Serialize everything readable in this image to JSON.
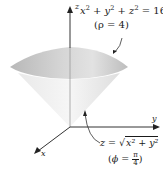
{
  "figure": {
    "axes": {
      "x_label": "x",
      "y_label": "y",
      "z_label": "z"
    },
    "sphere": {
      "equation_lhs_base": [
        "x",
        "y",
        "z"
      ],
      "equation_exponent": "2",
      "equation_plus": "+",
      "equation_rhs": "= 16",
      "rho_label": "(ρ = 4)"
    },
    "cone": {
      "equation_prefix": "z = √",
      "equation_radicand": "x² + y²",
      "phi_open": "(",
      "phi_text": "ϕ = ",
      "phi_num": "π",
      "phi_den": "4",
      "phi_close": ")"
    },
    "colors": {
      "cap_light": "#e6e6e6",
      "cap_dark": "#b5b5b5",
      "cone_light": "#f3f3f3",
      "cone_dark": "#d9d9d9",
      "axis": "#333333",
      "text": "#1a1a1a"
    }
  }
}
